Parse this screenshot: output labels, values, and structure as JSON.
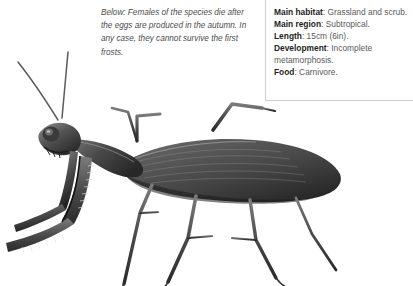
{
  "page": {
    "background": "#ffffff",
    "width": 413,
    "height": 286
  },
  "edge_label": {
    "text": "st"
  },
  "caption": {
    "text": "Below: Females of the species die after the eggs are produced in the autumn. In any case, they cannot survive the first frosts."
  },
  "factbox": {
    "border_color": "#cfcfcf",
    "label_color": "#1e1e1e",
    "value_color": "#5b5b5b",
    "entries": [
      {
        "label": "Main habitat",
        "value": ": Grassland and scrub."
      },
      {
        "label": "Main region",
        "value": ": Subtropical."
      },
      {
        "label": "Length",
        "value": ": 15cm (6in)."
      },
      {
        "label": "Development",
        "value": ": Incomplete metamorphosis."
      },
      {
        "label": "Food",
        "value": ": Carnivore."
      }
    ]
  },
  "illustration": {
    "name": "praying-mantis-photograph",
    "alt": "Black and white photograph of a praying mantis in profile, facing left, with raised forelegs, long antennae and an elongated wing-covered abdomen extending to the right."
  }
}
